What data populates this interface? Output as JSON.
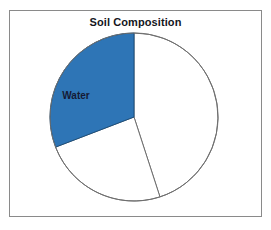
{
  "chart": {
    "title": "Soil Composition",
    "frame": {
      "border_color": "#8a8a8a",
      "background_color": "#ffffff"
    }
  },
  "chart_data": {
    "type": "pie",
    "title": "Soil Composition",
    "xlabel": "",
    "ylabel": "",
    "legend_position": "none",
    "grid": false,
    "center": [
      124,
      106
    ],
    "radius": 84,
    "start_angle_deg": 0,
    "direction": "clockwise",
    "categories": [
      "Minerals",
      "Air",
      "Water"
    ],
    "values": [
      45,
      24,
      31
    ],
    "slices": [
      {
        "label": "",
        "value": 45,
        "start_angle_deg": 0,
        "end_angle_deg": 162,
        "color": "#ffffff",
        "edge_color": "#6f6f6f",
        "label_shown": false
      },
      {
        "label": "",
        "value": 24,
        "start_angle_deg": 162,
        "end_angle_deg": 249,
        "color": "#ffffff",
        "edge_color": "#6f6f6f",
        "label_shown": false
      },
      {
        "label": "Water",
        "value": 31,
        "start_angle_deg": 249,
        "end_angle_deg": 360,
        "color": "#2e75b6",
        "edge_color": "#1b4f7d",
        "label_shown": true,
        "label_color": "#151a35",
        "label_pos": [
          66,
          88
        ]
      }
    ]
  }
}
